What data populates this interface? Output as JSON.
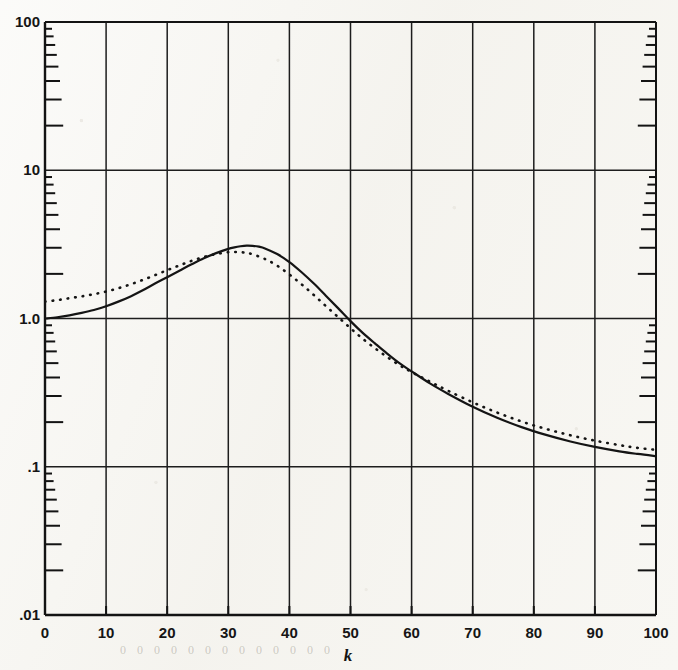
{
  "figure": {
    "background_color": "#f7f6f2",
    "ink_color": "#141414",
    "xaxis_title": "k",
    "ghost_bleed_text": "0 0      0 0 0 0 0 0   0 0 0 0 0",
    "y_tick_labels": [
      "100",
      "10",
      "1.0",
      ".1",
      ".01"
    ],
    "x_tick_labels": [
      "0",
      "10",
      "20",
      "30",
      "40",
      "50",
      "60",
      "70",
      "80",
      "90",
      "100"
    ]
  },
  "chart_data": {
    "type": "line",
    "title": "",
    "xlabel": "k",
    "ylabel": "",
    "xlim": [
      0,
      100
    ],
    "ylim": [
      0.01,
      100
    ],
    "yscale": "log",
    "xscale": "linear",
    "grid": true,
    "legend": "none",
    "xticks": [
      0,
      10,
      20,
      30,
      40,
      50,
      60,
      70,
      80,
      90,
      100
    ],
    "yticks": [
      0.01,
      0.1,
      1.0,
      10,
      100
    ],
    "ytick_labels": [
      ".01",
      ".1",
      "1.0",
      "10",
      "100"
    ],
    "y_minor_ticks_per_decade": [
      2,
      3,
      4,
      5,
      6,
      7,
      8,
      9
    ],
    "series": [
      {
        "name": "solid curve",
        "style": "solid",
        "color": "#141414",
        "linewidth": 2.2,
        "x": [
          0,
          2,
          4,
          6,
          8,
          10,
          12,
          14,
          16,
          18,
          20,
          22,
          24,
          26,
          28,
          30,
          31,
          32,
          33,
          34,
          35,
          36,
          38,
          40,
          42,
          44,
          46,
          48,
          50,
          52,
          54,
          56,
          58,
          60,
          63,
          66,
          70,
          74,
          78,
          82,
          86,
          90,
          94,
          97,
          100
        ],
        "y": [
          1.0,
          1.02,
          1.05,
          1.09,
          1.14,
          1.21,
          1.3,
          1.41,
          1.55,
          1.72,
          1.9,
          2.1,
          2.32,
          2.55,
          2.76,
          2.95,
          3.02,
          3.07,
          3.1,
          3.09,
          3.05,
          2.97,
          2.72,
          2.4,
          2.05,
          1.72,
          1.42,
          1.17,
          0.96,
          0.8,
          0.68,
          0.58,
          0.5,
          0.44,
          0.365,
          0.31,
          0.254,
          0.214,
          0.185,
          0.164,
          0.148,
          0.136,
          0.127,
          0.122,
          0.118
        ]
      },
      {
        "name": "dotted curve",
        "style": "dotted",
        "color": "#141414",
        "linewidth": 2.6,
        "x": [
          0,
          2,
          4,
          6,
          8,
          10,
          12,
          14,
          16,
          18,
          20,
          22,
          24,
          26,
          28,
          30,
          31,
          32,
          33,
          34,
          36,
          38,
          40,
          42,
          44,
          46,
          48,
          50,
          52,
          54,
          56,
          58,
          60,
          63,
          66,
          70,
          74,
          78,
          82,
          86,
          90,
          94,
          97,
          100
        ],
        "y": [
          1.3,
          1.33,
          1.37,
          1.41,
          1.46,
          1.52,
          1.6,
          1.7,
          1.82,
          1.96,
          2.12,
          2.28,
          2.45,
          2.6,
          2.72,
          2.8,
          2.81,
          2.8,
          2.77,
          2.71,
          2.52,
          2.27,
          1.98,
          1.7,
          1.44,
          1.21,
          1.02,
          0.86,
          0.73,
          0.63,
          0.55,
          0.485,
          0.435,
          0.375,
          0.325,
          0.272,
          0.232,
          0.202,
          0.18,
          0.163,
          0.15,
          0.14,
          0.134,
          0.13
        ]
      }
    ],
    "annotations": [
      {
        "text": "solid curve peak",
        "x": 33,
        "y": 3.1
      },
      {
        "text": "dotted curve peak",
        "x": 31,
        "y": 2.81
      },
      {
        "text": "curves cross near",
        "x": 60,
        "y": 0.44
      }
    ]
  }
}
